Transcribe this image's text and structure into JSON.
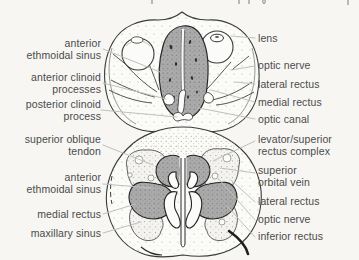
{
  "figure": {
    "background": "#f7f6f3",
    "ink": "#3b3b3b",
    "label_color": "#4b4b4b",
    "leader_color": "#c0bfbd",
    "sinus_gray": "#ababab"
  },
  "top_edge_fragments": "illegible cropped letter descenders from the text line above the figure",
  "labels": {
    "top_left": [
      {
        "id": "anterior-ethmoidal-sinus-upper",
        "lines": [
          "anterior",
          "ethmoidal sinus"
        ]
      },
      {
        "id": "anterior-clinoid-processes",
        "lines": [
          "anterior clinoid",
          "processes"
        ]
      },
      {
        "id": "posterior-clinoid-process",
        "lines": [
          "posterior clinoid",
          "process"
        ]
      }
    ],
    "top_right": [
      {
        "id": "lens",
        "lines": [
          "lens"
        ]
      },
      {
        "id": "optic-nerve-upper",
        "lines": [
          "optic nerve"
        ]
      },
      {
        "id": "lateral-rectus-upper",
        "lines": [
          "lateral rectus"
        ]
      },
      {
        "id": "medial-rectus-upper",
        "lines": [
          "medial rectus"
        ]
      },
      {
        "id": "optic-canal",
        "lines": [
          "optic canal"
        ]
      }
    ],
    "bottom_left": [
      {
        "id": "superior-oblique-tendon",
        "lines": [
          "superior oblique",
          "tendon"
        ]
      },
      {
        "id": "anterior-ethmoidal-sinus-lower",
        "lines": [
          "anterior",
          "ethmoidal sinus"
        ]
      },
      {
        "id": "medial-rectus-lower",
        "lines": [
          "medial rectus"
        ]
      },
      {
        "id": "maxillary-sinus",
        "lines": [
          "maxillary sinus"
        ]
      }
    ],
    "bottom_right": [
      {
        "id": "levator-superior-rectus-complex",
        "lines": [
          "levator/superior",
          "rectus complex"
        ]
      },
      {
        "id": "superior-orbital-vein",
        "lines": [
          "superior",
          "orbital vein"
        ]
      },
      {
        "id": "lateral-rectus-lower",
        "lines": [
          "lateral rectus"
        ]
      },
      {
        "id": "optic-nerve-lower",
        "lines": [
          "optic nerve"
        ]
      },
      {
        "id": "inferior-rectus",
        "lines": [
          "inferior rectus"
        ]
      }
    ]
  }
}
